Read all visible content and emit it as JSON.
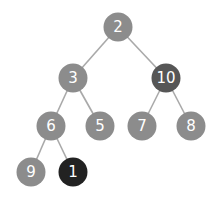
{
  "diagram": {
    "type": "binary-tree",
    "colors": {
      "default_node": "#8c8c8c",
      "highlight_node": "#565656",
      "active_node": "#222222",
      "edge": "#a9a9a9",
      "label": "#ffffff"
    },
    "nodes": [
      {
        "id": "n2",
        "label": "2",
        "x": 118,
        "y": 27,
        "style": "default"
      },
      {
        "id": "n3",
        "label": "3",
        "x": 73,
        "y": 78,
        "style": "default"
      },
      {
        "id": "n10",
        "label": "10",
        "x": 166,
        "y": 78,
        "style": "highlight"
      },
      {
        "id": "n6",
        "label": "6",
        "x": 51,
        "y": 126,
        "style": "default"
      },
      {
        "id": "n5",
        "label": "5",
        "x": 100,
        "y": 126,
        "style": "default"
      },
      {
        "id": "n7",
        "label": "7",
        "x": 142,
        "y": 126,
        "style": "default"
      },
      {
        "id": "n8",
        "label": "8",
        "x": 191,
        "y": 126,
        "style": "default"
      },
      {
        "id": "n9",
        "label": "9",
        "x": 31,
        "y": 172,
        "style": "default"
      },
      {
        "id": "n1",
        "label": "1",
        "x": 73,
        "y": 172,
        "style": "active"
      }
    ],
    "edges": [
      [
        "n2",
        "n3"
      ],
      [
        "n2",
        "n10"
      ],
      [
        "n3",
        "n6"
      ],
      [
        "n3",
        "n5"
      ],
      [
        "n10",
        "n7"
      ],
      [
        "n10",
        "n8"
      ],
      [
        "n6",
        "n9"
      ],
      [
        "n6",
        "n1"
      ]
    ]
  }
}
